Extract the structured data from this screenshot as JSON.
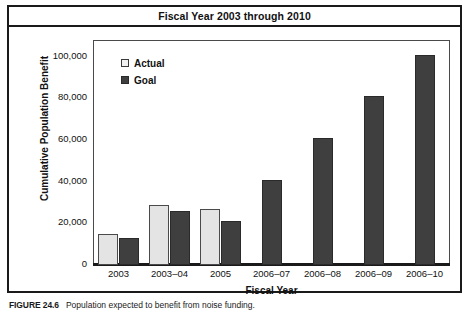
{
  "figure": {
    "caption_number": "FIGURE 24.6",
    "caption_text": "Population expected to benefit from noise funding."
  },
  "chart_data": {
    "type": "bar",
    "title": "Fiscal Year 2003 through 2010",
    "xlabel": "Fiscal Year",
    "ylabel": "Cumulative Population Benefit",
    "categories": [
      "2003",
      "2003–04",
      "2005",
      "2006–07",
      "2006–08",
      "2006–09",
      "2006–10"
    ],
    "series": [
      {
        "name": "Actual",
        "color": "#e4e4e4",
        "values": [
          14000,
          28000,
          26000,
          null,
          null,
          null,
          null
        ]
      },
      {
        "name": "Goal",
        "color": "#3f3f3f",
        "values": [
          12000,
          25000,
          20000,
          40000,
          60000,
          80000,
          100000
        ]
      }
    ],
    "ylim": [
      0,
      107000
    ],
    "yticks": [
      0,
      20000,
      40000,
      60000,
      80000,
      100000
    ],
    "ytick_labels": [
      "0",
      "20,000",
      "40,000",
      "60,000",
      "80,000",
      "100,000"
    ],
    "grid": false,
    "legend_position": "upper-left"
  }
}
